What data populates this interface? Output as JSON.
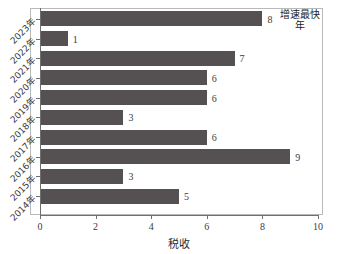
{
  "chart_data": {
    "type": "bar",
    "orientation": "horizontal",
    "title": "",
    "xlabel": "税收",
    "ylabel": "",
    "categories": [
      "2023年",
      "2022年",
      "2021年",
      "2020年",
      "2019年",
      "2018年",
      "2017年",
      "2016年",
      "2015年",
      "2014年"
    ],
    "values": [
      8,
      1,
      7,
      6,
      6,
      3,
      6,
      9,
      3,
      5
    ],
    "xlim": [
      0,
      10
    ],
    "xticks": [
      0,
      2,
      4,
      6,
      8,
      10
    ],
    "xtick_labels": [
      "0",
      "2",
      "4",
      "6",
      "8",
      "10"
    ],
    "grid": false,
    "legend": null,
    "bar_color": "#555152",
    "annotations": [
      {
        "category": "2023年",
        "text": "增速最快年"
      }
    ]
  },
  "axis": {
    "x_title": "税收"
  },
  "colors": {
    "bar": "#555152",
    "axis": "#6f6f6f",
    "frame": "#b9b9b9",
    "text": "#3b3b3b",
    "background": "#ffffff"
  }
}
